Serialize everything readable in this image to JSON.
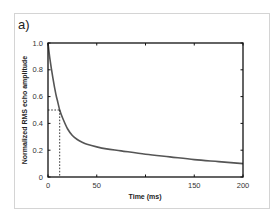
{
  "panel_label": "a)",
  "colors": {
    "curve": "#555555",
    "axis": "#111111",
    "frame": "#d4d4d4"
  },
  "chart_data": {
    "type": "line",
    "title": "",
    "panel": "a)",
    "xlabel": "Time (ms)",
    "ylabel": "Normalized RMS echo amplitude",
    "xlim": [
      0,
      200
    ],
    "ylim": [
      0,
      1.0
    ],
    "x_tick_values": [
      0,
      50,
      100,
      150,
      200
    ],
    "x_tick_labels": [
      "0",
      "50",
      "",
      "150",
      "200"
    ],
    "y_tick_values": [
      0,
      0.2,
      0.4,
      0.6,
      0.8,
      1.0
    ],
    "y_tick_labels": [
      "0",
      "0.2",
      "0.4",
      "0.6",
      "0.8",
      "1.0"
    ],
    "grid": false,
    "legend": null,
    "series": [
      {
        "name": "Normalized RMS echo amplitude",
        "x": [
          0,
          2,
          5,
          8,
          10,
          12,
          15,
          20,
          25,
          30,
          35,
          40,
          50,
          60,
          75,
          100,
          125,
          150,
          175,
          200
        ],
        "values": [
          1.0,
          0.88,
          0.74,
          0.62,
          0.56,
          0.5,
          0.44,
          0.36,
          0.31,
          0.28,
          0.26,
          0.245,
          0.225,
          0.21,
          0.195,
          0.17,
          0.15,
          0.13,
          0.115,
          0.1
        ]
      }
    ],
    "annotations": [
      {
        "type": "dashed-guide",
        "x": 12,
        "y": 0.5,
        "description": "dotted lines marking half-amplitude at ~12 ms"
      }
    ]
  }
}
